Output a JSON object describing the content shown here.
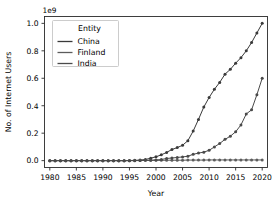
{
  "chart_data": {
    "type": "line",
    "title": "",
    "xlabel": "Year",
    "ylabel": "No. of Internet Users",
    "y_offset_text": "1e9",
    "y_offset_multiplier": 1000000000,
    "xlim": [
      1979,
      2021
    ],
    "ylim": [
      -0.05,
      1.05
    ],
    "xticks": [
      1980,
      1985,
      1990,
      1995,
      2000,
      2005,
      2010,
      2015,
      2020
    ],
    "xticklabels": [
      "1980",
      "1985",
      "1990",
      "1995",
      "2000",
      "2005",
      "2010",
      "2015",
      "2020"
    ],
    "yticks": [
      0.0,
      0.2,
      0.4,
      0.6,
      0.8,
      1.0
    ],
    "yticklabels": [
      "0.0",
      "0.2",
      "0.4",
      "0.6",
      "0.8",
      "1.0"
    ],
    "grid": false,
    "legend_position": "upper left",
    "legend_title": "Entity",
    "marker": "circle",
    "x": [
      1980,
      1981,
      1982,
      1983,
      1984,
      1985,
      1986,
      1987,
      1988,
      1989,
      1990,
      1991,
      1992,
      1993,
      1994,
      1995,
      1996,
      1997,
      1998,
      1999,
      2000,
      2001,
      2002,
      2003,
      2004,
      2005,
      2006,
      2007,
      2008,
      2009,
      2010,
      2011,
      2012,
      2013,
      2014,
      2015,
      2016,
      2017,
      2018,
      2019,
      2020
    ],
    "series": [
      {
        "name": "China",
        "color": "#3a3a3a",
        "values": [
          0.0,
          0.0,
          0.0,
          0.0,
          0.0,
          0.0,
          0.0,
          0.0,
          0.0,
          0.0,
          0.0,
          0.0,
          0.0,
          0.0,
          0.0,
          0.001,
          0.002,
          0.004,
          0.008,
          0.018,
          0.028,
          0.042,
          0.06,
          0.081,
          0.095,
          0.112,
          0.145,
          0.215,
          0.3,
          0.39,
          0.46,
          0.52,
          0.57,
          0.63,
          0.665,
          0.71,
          0.75,
          0.8,
          0.86,
          0.93,
          1.0
        ]
      },
      {
        "name": "Finland",
        "color": "#5c5c5c",
        "values": [
          0.0,
          0.0,
          0.0,
          0.0,
          0.0,
          0.0,
          0.0,
          0.0,
          0.0,
          0.0,
          0.0,
          0.0,
          0.0,
          0.0,
          0.0,
          0.0,
          0.001,
          0.001,
          0.002,
          0.002,
          0.002,
          0.002,
          0.003,
          0.003,
          0.003,
          0.003,
          0.004,
          0.004,
          0.004,
          0.004,
          0.005,
          0.005,
          0.005,
          0.005,
          0.005,
          0.005,
          0.005,
          0.005,
          0.005,
          0.005,
          0.005
        ]
      },
      {
        "name": "India",
        "color": "#4a4a4a",
        "values": [
          0.0,
          0.0,
          0.0,
          0.0,
          0.0,
          0.0,
          0.0,
          0.0,
          0.0,
          0.0,
          0.0,
          0.0,
          0.0,
          0.0,
          0.0,
          0.0,
          0.0,
          0.001,
          0.002,
          0.003,
          0.005,
          0.008,
          0.016,
          0.019,
          0.023,
          0.027,
          0.032,
          0.046,
          0.055,
          0.062,
          0.075,
          0.1,
          0.125,
          0.155,
          0.178,
          0.21,
          0.26,
          0.34,
          0.37,
          0.48,
          0.6
        ]
      }
    ]
  }
}
